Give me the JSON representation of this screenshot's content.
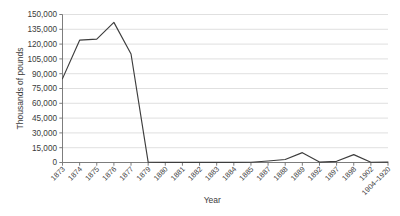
{
  "chart_data": {
    "type": "line",
    "title": "",
    "subtitle": "",
    "xlabel": "Year",
    "ylabel": "Thousands of pounds",
    "categories": [
      "1873",
      "1874",
      "1875",
      "1876",
      "1877",
      "1879",
      "1880",
      "1881",
      "1882",
      "1883",
      "1884",
      "1885",
      "1887",
      "1888",
      "1889",
      "1892",
      "1897",
      "1898",
      "1902",
      "1904–1920"
    ],
    "series": [
      {
        "name": "Thousands of pounds",
        "values": [
          85000,
          124000,
          125000,
          142000,
          110000,
          300,
          200,
          200,
          200,
          200,
          200,
          300,
          1500,
          3000,
          10000,
          400,
          1200,
          8000,
          300,
          400
        ]
      }
    ],
    "values": [
      85000,
      124000,
      125000,
      142000,
      110000,
      300,
      200,
      200,
      200,
      200,
      200,
      300,
      1500,
      3000,
      10000,
      400,
      1200,
      8000,
      300,
      400
    ],
    "ylim": [
      0,
      150000
    ],
    "ytick_step": 15000,
    "yticks": [
      0,
      15000,
      30000,
      45000,
      60000,
      75000,
      90000,
      105000,
      120000,
      135000,
      150000
    ],
    "ytick_labels": [
      "0",
      "15,000",
      "30,000",
      "45,000",
      "60,000",
      "75,000",
      "90,000",
      "105,000",
      "120,000",
      "135,000",
      "150,000"
    ],
    "grid": true,
    "grid_axis": "y",
    "legend": false,
    "legend_position": "none",
    "line_color": "#3d3d3d",
    "grid_color": "#d2d2d2",
    "axis_color": "#6e6e6e",
    "background_color": "#ffffff",
    "xtick_rotation": -45,
    "annotations": []
  }
}
